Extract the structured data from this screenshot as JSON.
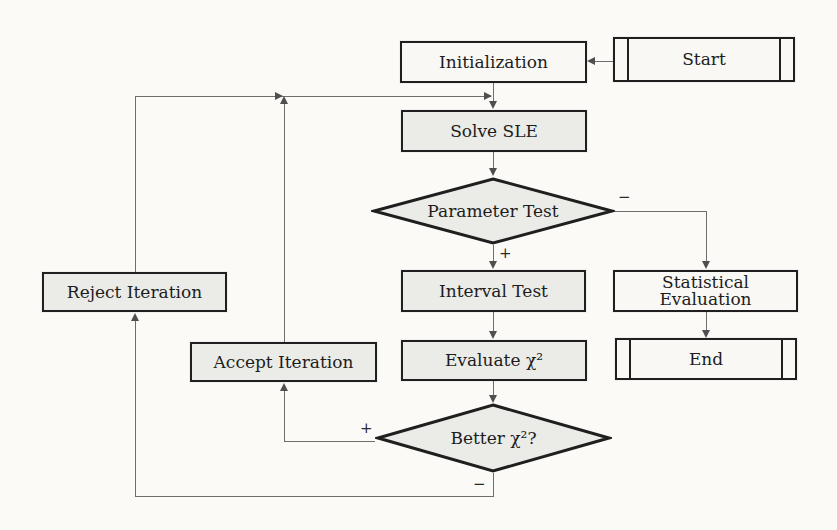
{
  "figure": {
    "type": "flowchart"
  },
  "colors": {
    "paper": "#fbfaf7",
    "node_border": "#1f1f1f",
    "node_fill_gray": "#ebebe7",
    "node_fill_white": "#f9f8f4",
    "connector": "#6e6e6e"
  },
  "nodes": {
    "start": {
      "label": "Start",
      "shape": "terminator"
    },
    "initialization": {
      "label": "Initialization",
      "shape": "process"
    },
    "solve_sle": {
      "label": "Solve SLE",
      "shape": "process"
    },
    "parameter_test": {
      "label": "Parameter Test",
      "shape": "decision"
    },
    "interval_test": {
      "label": "Interval Test",
      "shape": "process"
    },
    "statistical_evaluation": {
      "label": "Statistical Evaluation",
      "shape": "process"
    },
    "evaluate_chi2": {
      "label": "Evaluate χ²",
      "shape": "process"
    },
    "end": {
      "label": "End",
      "shape": "terminator"
    },
    "accept_iteration": {
      "label": "Accept Iteration",
      "shape": "process"
    },
    "reject_iteration": {
      "label": "Reject Iteration",
      "shape": "process"
    },
    "better_chi2": {
      "label": "Better χ²?",
      "shape": "decision"
    }
  },
  "edges": [
    {
      "from": "start",
      "to": "initialization",
      "label": ""
    },
    {
      "from": "initialization",
      "to": "solve_sle",
      "label": ""
    },
    {
      "from": "solve_sle",
      "to": "parameter_test",
      "label": ""
    },
    {
      "from": "parameter_test",
      "to": "interval_test",
      "label": "+"
    },
    {
      "from": "parameter_test",
      "to": "statistical_evaluation",
      "label": "−"
    },
    {
      "from": "interval_test",
      "to": "evaluate_chi2",
      "label": ""
    },
    {
      "from": "evaluate_chi2",
      "to": "better_chi2",
      "label": ""
    },
    {
      "from": "better_chi2",
      "to": "accept_iteration",
      "label": "+"
    },
    {
      "from": "better_chi2",
      "to": "reject_iteration",
      "label": "−"
    },
    {
      "from": "accept_iteration",
      "to": "solve_sle",
      "label": ""
    },
    {
      "from": "reject_iteration",
      "to": "solve_sle",
      "label": ""
    },
    {
      "from": "statistical_evaluation",
      "to": "end",
      "label": ""
    }
  ]
}
